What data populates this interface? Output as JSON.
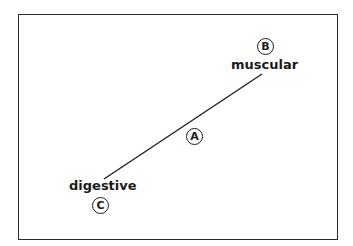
{
  "diagram": {
    "labels": {
      "top_right": "muscular",
      "bottom_left": "digestive"
    },
    "markers": {
      "a": "A",
      "b": "B",
      "c": "C"
    },
    "line": {
      "x1": 262,
      "y1": 74,
      "x2": 104,
      "y2": 179
    },
    "colors": {
      "stroke": "#1a1a1a",
      "background": "#ffffff"
    }
  }
}
